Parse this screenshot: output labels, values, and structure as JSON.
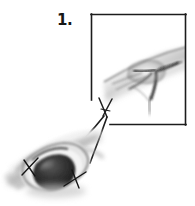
{
  "figure": {
    "kind": "surgical-procedure-illustration",
    "step_label": "1.",
    "caption": "",
    "width_px": 195,
    "height_px": 206,
    "background_color": "#ffffff"
  },
  "inset": {
    "name": "magnified-detail-box",
    "frame_color": "#1c1c1c",
    "frame_width_px": 1.6,
    "open_corner": "bottom-left",
    "bounds": {
      "left": 91,
      "top": 14,
      "right": 186,
      "bottom": 125
    },
    "left_edge_ends_y": 100,
    "bottom_edge_starts_x": 110,
    "content_description": "magnified grayscale view of tissue defect with dark radiating creases"
  },
  "main_illustration": {
    "name": "wound-site-illustration",
    "description": "grayscale anatomical drawing of an incised wound with a dark protruding mass, retraction sutures and a grasping forceps",
    "bounds": {
      "left": 6,
      "top": 128,
      "right": 104,
      "bottom": 196
    },
    "mass_color": "#2b2b2b",
    "tissue_highlight_color": "#f2f2f2",
    "tissue_shadow_color": "#9a9a9a"
  },
  "instrument": {
    "name": "forceps",
    "description": "crossed-tip grasping forceps extending from the wound up toward the inset box",
    "line_color": "#202020",
    "tip_x": 104,
    "tip_y": 98
  },
  "sutures": [
    {
      "name": "suture-left",
      "x": 30,
      "y": 168,
      "color": "#161616"
    },
    {
      "name": "suture-right",
      "x": 76,
      "y": 178,
      "color": "#161616"
    }
  ],
  "leader_line": {
    "name": "inset-leader-line",
    "from_x": 110,
    "from_y": 125,
    "to_x": 186,
    "to_y": 125,
    "color": "#1c1c1c"
  },
  "palette": {
    "ink": "#161616",
    "frame": "#1c1c1c",
    "mid_gray": "#8c8c8c",
    "light_gray": "#d8d8d8",
    "paper": "#ffffff"
  }
}
